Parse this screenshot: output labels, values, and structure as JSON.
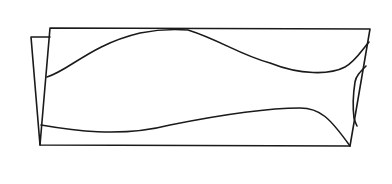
{
  "diagram": {
    "type": "line-drawing",
    "colors": {
      "background": "#ffffff",
      "stroke": "#1a1a1a"
    },
    "stroke_width": 1.6,
    "shapes": {
      "back_panel_edge": {
        "points": [
          [
            31,
            37
          ],
          [
            50,
            37
          ]
        ],
        "to_bottom": [
          40,
          145
        ]
      },
      "front_panel": {
        "top_left": [
          50,
          28
        ],
        "top_right": [
          370,
          29
        ],
        "bottom_right": [
          350,
          146
        ],
        "bottom_left": [
          40,
          145
        ]
      },
      "top_wave": "M47,77 C70,70 90,45 140,33 C160,29 175,29 188,30 C220,40 240,55 270,63 C300,75 330,75 345,67 C355,62 362,50 369,42",
      "bottom_wave": "M41,125 C70,130 120,138 170,125 C220,115 270,108 300,108 C320,108 330,118 350,146",
      "right_loop": "M366,66 C360,72 356,76 355,82 C353,95 353,110 354,118 C355,122 356,124 357,126"
    }
  }
}
